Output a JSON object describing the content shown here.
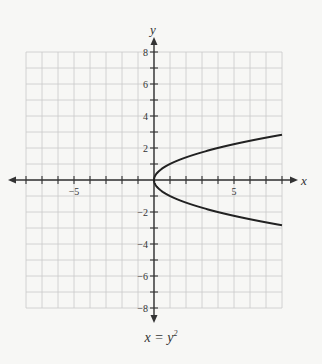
{
  "chart_data": {
    "type": "line",
    "title": "",
    "equation": "x = y^2",
    "xlabel": "x",
    "ylabel": "y",
    "xlim": [
      -8,
      8
    ],
    "ylim": [
      -8,
      8
    ],
    "grid": true,
    "grid_step": 1,
    "x_tick_labels": [
      {
        "value": -5,
        "label": "-5"
      },
      {
        "value": 5,
        "label": "5"
      }
    ],
    "y_tick_labels": [
      {
        "value": 8,
        "label": "8"
      },
      {
        "value": 6,
        "label": "6"
      },
      {
        "value": 4,
        "label": "4"
      },
      {
        "value": 2,
        "label": "2"
      },
      {
        "value": -2,
        "label": "-2"
      },
      {
        "value": -4,
        "label": "-4"
      },
      {
        "value": -6,
        "label": "-6"
      },
      {
        "value": -8,
        "label": "-8"
      }
    ],
    "series": [
      {
        "name": "x = y^2",
        "points": [
          [
            8,
            2.83
          ],
          [
            6.25,
            2.5
          ],
          [
            4,
            2
          ],
          [
            2.25,
            1.5
          ],
          [
            1,
            1
          ],
          [
            0.25,
            0.5
          ],
          [
            0,
            0
          ],
          [
            0.25,
            -0.5
          ],
          [
            1,
            -1
          ],
          [
            2.25,
            -1.5
          ],
          [
            4,
            -2
          ],
          [
            6.25,
            -2.5
          ],
          [
            8,
            -2.83
          ]
        ],
        "color": "#222222"
      }
    ],
    "legend": null
  },
  "caption": {
    "lhs": "x = y",
    "exp": "2"
  },
  "colors": {
    "background": "#f7f7f5",
    "grid": "#c9c9c9",
    "axis": "#333333",
    "curve": "#222222"
  }
}
